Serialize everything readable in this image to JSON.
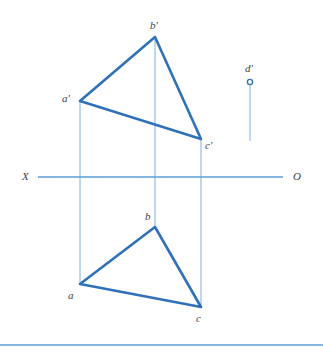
{
  "figure": {
    "cropped_header_text": "— —— — —— ——— ——",
    "colors": {
      "primary_stroke": "#2f71b8",
      "projection_line": "#7fb0dd",
      "ground_line": "#5e9ed6",
      "bottom_rule": "#5e9ed6",
      "label_text": "#3d4043",
      "background": "#ffffff"
    },
    "ground_line": {
      "left_label": "X",
      "right_label": "O",
      "y": 177,
      "x_start": 38,
      "x_end": 283
    },
    "frontal_projection": {
      "name": "frontal-triangle",
      "vertices": [
        {
          "id": "a-prime",
          "label": "a'",
          "x": 80,
          "y": 101,
          "label_x": 62,
          "label_y": 93
        },
        {
          "id": "b-prime",
          "label": "b'",
          "x": 155,
          "y": 37,
          "label_x": 150,
          "label_y": 20
        },
        {
          "id": "c-prime",
          "label": "c'",
          "x": 201,
          "y": 139,
          "label_x": 205,
          "label_y": 140
        }
      ]
    },
    "horizontal_projection": {
      "name": "horizontal-triangle",
      "vertices": [
        {
          "id": "a",
          "label": "a",
          "x": 80,
          "y": 284,
          "label_x": 68,
          "label_y": 290
        },
        {
          "id": "b",
          "label": "b",
          "x": 155,
          "y": 227,
          "label_x": 145,
          "label_y": 211
        },
        {
          "id": "c",
          "label": "c",
          "x": 201,
          "y": 307,
          "label_x": 196,
          "label_y": 313
        }
      ]
    },
    "isolated_point": {
      "id": "d-prime",
      "label": "d'",
      "x": 250,
      "y": 82,
      "label_x": 245,
      "label_y": 63,
      "marker": "open-circle",
      "radius": 2.6,
      "drop_line_end_y": 141
    },
    "projection_lines": [
      {
        "id": "projector-a",
        "x": 80,
        "y_top": 101,
        "y_bottom": 284
      },
      {
        "id": "projector-b",
        "x": 155,
        "y_top": 37,
        "y_bottom": 227
      },
      {
        "id": "projector-c",
        "x": 201,
        "y_top": 139,
        "y_bottom": 307
      }
    ],
    "bottom_rule": {
      "y": 345,
      "x_start": 0,
      "x_end": 323
    }
  },
  "chart_data": {
    "type": "diagram",
    "ground_line_label_left": "X",
    "ground_line_label_right": "O",
    "points": [
      {
        "name": "a'",
        "view": "frontal",
        "x": 80,
        "y": 101
      },
      {
        "name": "b'",
        "view": "frontal",
        "x": 155,
        "y": 37
      },
      {
        "name": "c'",
        "view": "frontal",
        "x": 201,
        "y": 139
      },
      {
        "name": "d'",
        "view": "frontal",
        "x": 250,
        "y": 82
      },
      {
        "name": "a",
        "view": "horizontal",
        "x": 80,
        "y": 284
      },
      {
        "name": "b",
        "view": "horizontal",
        "x": 155,
        "y": 227
      },
      {
        "name": "c",
        "view": "horizontal",
        "x": 201,
        "y": 307
      }
    ],
    "edges": [
      {
        "from": "a'",
        "to": "b'"
      },
      {
        "from": "b'",
        "to": "c'"
      },
      {
        "from": "c'",
        "to": "a'"
      },
      {
        "from": "a",
        "to": "b"
      },
      {
        "from": "b",
        "to": "c"
      },
      {
        "from": "c",
        "to": "a"
      }
    ]
  }
}
